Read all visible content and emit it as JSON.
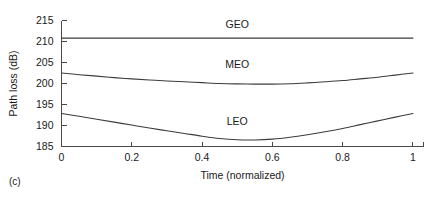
{
  "figure": {
    "caption": "(c)"
  },
  "chart_data": {
    "type": "line",
    "title": "",
    "xlabel": "Time (normalized)",
    "ylabel": "Path loss (dB)",
    "xlim": [
      0,
      1.03
    ],
    "ylim": [
      185,
      215
    ],
    "grid": false,
    "legend_position": "inline-labels",
    "xticks": [
      0,
      0.2,
      0.4,
      0.6,
      0.8,
      1
    ],
    "xticklabels": [
      "0",
      "0.2",
      "0.4",
      "0.6",
      "0.8",
      "1"
    ],
    "yticks": [
      185,
      190,
      195,
      200,
      205,
      210,
      215
    ],
    "yticklabels": [
      "185",
      "190",
      "195",
      "200",
      "205",
      "210",
      "215"
    ],
    "x": [
      0,
      0.05,
      0.1,
      0.15,
      0.2,
      0.25,
      0.3,
      0.35,
      0.4,
      0.45,
      0.5,
      0.55,
      0.6,
      0.65,
      0.7,
      0.75,
      0.8,
      0.85,
      0.9,
      0.95,
      1
    ],
    "series": [
      {
        "name": "GEO",
        "label": "GEO",
        "label_x": 0.5,
        "label_y": 213.3,
        "values": [
          210.8,
          210.8,
          210.8,
          210.8,
          210.8,
          210.8,
          210.8,
          210.8,
          210.8,
          210.8,
          210.8,
          210.8,
          210.8,
          210.8,
          210.8,
          210.8,
          210.8,
          210.8,
          210.8,
          210.8,
          210.8
        ]
      },
      {
        "name": "MEO",
        "label": "MEO",
        "label_x": 0.5,
        "label_y": 203.6,
        "values": [
          202.5,
          202.1,
          201.75,
          201.4,
          201.1,
          200.85,
          200.6,
          200.4,
          200.2,
          200.0,
          199.9,
          199.85,
          199.85,
          199.95,
          200.15,
          200.4,
          200.7,
          201.1,
          201.5,
          202.0,
          202.5
        ]
      },
      {
        "name": "LEO",
        "label": "LEO",
        "label_x": 0.5,
        "label_y": 190.2,
        "values": [
          192.85,
          192.2,
          191.5,
          190.8,
          190.1,
          189.4,
          188.75,
          188.1,
          187.45,
          186.9,
          186.6,
          186.55,
          186.75,
          187.2,
          187.8,
          188.5,
          189.3,
          190.2,
          191.1,
          192.0,
          192.85
        ]
      }
    ]
  }
}
